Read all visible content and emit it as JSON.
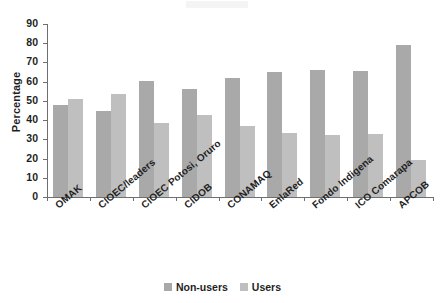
{
  "chart_data": {
    "type": "bar",
    "title": "",
    "xlabel": "",
    "ylabel": "Percentage",
    "ylim": [
      0,
      90
    ],
    "ytick_step": 10,
    "yticks": [
      90,
      80,
      70,
      60,
      50,
      40,
      30,
      20,
      10,
      0
    ],
    "grid": false,
    "legend_position": "bottom",
    "categories": [
      "OMAK",
      "CIOEC/leaders",
      "CIOEC Potosi, Oruro",
      "CIDOB",
      "CONAMAQ",
      "EnlaRed",
      "Fondo Indigena",
      "ICO Comarapa",
      "APCOB"
    ],
    "series": [
      {
        "name": "Non-users",
        "color": "#a9a9a9",
        "values": [
          48,
          45,
          60.5,
          56,
          62,
          65,
          66,
          65.5,
          79
        ]
      },
      {
        "name": "Users",
        "color": "#bfbfbf",
        "values": [
          51,
          53.5,
          38.5,
          42.5,
          37,
          33.5,
          32.5,
          33,
          19.5
        ]
      }
    ]
  },
  "legend": {
    "items": [
      {
        "label": "Non-users",
        "color": "#a9a9a9"
      },
      {
        "label": "Users",
        "color": "#bfbfbf"
      }
    ]
  }
}
